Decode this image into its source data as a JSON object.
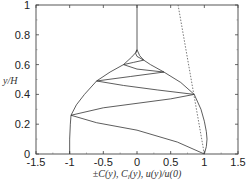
{
  "chart_data": {
    "type": "line",
    "title": "",
    "xlabel": "±C(y), C_l(y), u(y)/u(0)",
    "xlabel_parts": [
      "±",
      "C(y), ",
      "C",
      "l",
      "(y), ",
      "u(y)/u(0)"
    ],
    "ylabel": "y/H",
    "xlim": [
      -1.5,
      1.5
    ],
    "ylim": [
      0,
      1
    ],
    "xticks": [
      -1.5,
      -1,
      -0.5,
      0,
      0.5,
      1,
      1.5
    ],
    "xtick_labels": [
      "-1.5",
      "-1",
      "-0.5",
      "0",
      "0.5",
      "1",
      "1.5"
    ],
    "yticks": [
      0,
      0.2,
      0.4,
      0.6,
      0.8,
      1
    ],
    "ytick_labels": [
      "0",
      "0.2",
      "0.4",
      "0.6",
      "0.8",
      "1"
    ],
    "grid": false,
    "legend": null,
    "series": [
      {
        "name": "envelope +C(y)",
        "style": "solid",
        "color": "#333333",
        "points": [
          [
            1.0,
            0.0
          ],
          [
            1.03,
            0.05
          ],
          [
            1.04,
            0.1
          ],
          [
            1.03,
            0.15
          ],
          [
            1.0,
            0.22
          ],
          [
            0.95,
            0.3
          ],
          [
            0.85,
            0.4
          ],
          [
            0.65,
            0.48
          ],
          [
            0.4,
            0.55
          ],
          [
            0.2,
            0.6
          ],
          [
            0.1,
            0.63
          ],
          [
            0.04,
            0.66
          ],
          [
            0.0,
            0.7
          ]
        ]
      },
      {
        "name": "envelope -C(y)",
        "style": "solid",
        "color": "#333333",
        "points": [
          [
            -1.0,
            0.0
          ],
          [
            -1.0,
            0.1
          ],
          [
            -0.99,
            0.2
          ],
          [
            -0.98,
            0.26
          ],
          [
            -0.9,
            0.33
          ],
          [
            -0.78,
            0.4
          ],
          [
            -0.6,
            0.49
          ],
          [
            -0.4,
            0.55
          ],
          [
            -0.2,
            0.6
          ],
          [
            -0.08,
            0.65
          ],
          [
            -0.02,
            0.68
          ],
          [
            0.0,
            0.7
          ]
        ]
      },
      {
        "name": "C_l(y)",
        "style": "solid",
        "color": "#333333",
        "points": [
          [
            1.0,
            0.0
          ],
          [
            0.6,
            0.08
          ],
          [
            0.0,
            0.16
          ],
          [
            -0.6,
            0.21
          ],
          [
            -0.98,
            0.26
          ],
          [
            -0.5,
            0.31
          ],
          [
            0.0,
            0.34
          ],
          [
            0.5,
            0.37
          ],
          [
            0.85,
            0.4
          ],
          [
            0.3,
            0.43
          ],
          [
            -0.2,
            0.46
          ],
          [
            -0.6,
            0.49
          ],
          [
            -0.1,
            0.52
          ],
          [
            0.4,
            0.55
          ],
          [
            0.0,
            0.57
          ],
          [
            -0.2,
            0.6
          ],
          [
            -0.05,
            0.615
          ],
          [
            0.1,
            0.63
          ],
          [
            0.0,
            0.655
          ],
          [
            -0.02,
            0.675
          ],
          [
            0.0,
            0.7
          ],
          [
            0.0,
            1.0
          ]
        ]
      },
      {
        "name": "u(y)/u(0)",
        "style": "dashed",
        "color": "#555555",
        "points": [
          [
            1.0,
            0.0
          ],
          [
            0.61,
            1.0
          ]
        ]
      }
    ]
  },
  "axes": {
    "ylabel_text": "y/H"
  }
}
